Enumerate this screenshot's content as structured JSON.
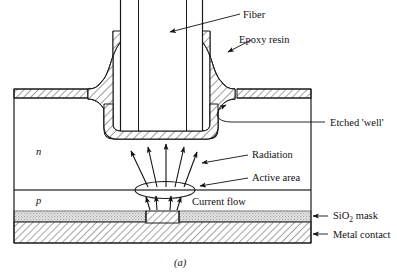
{
  "figure": {
    "caption": "(a)",
    "labels": {
      "fiber": "Fiber",
      "epoxy": "Epoxy resin",
      "etched_well": "Etched 'well'",
      "radiation": "Radiation",
      "active_area": "Active area",
      "current_flow": "Current flow",
      "sio2_mask_pre": "SiO",
      "sio2_mask_sub": "2",
      "sio2_mask_post": " mask",
      "metal_contact": "Metal contact",
      "n_region": "n",
      "p_region": "p"
    },
    "colors": {
      "stroke": "#1a1a1a",
      "hatch": "#555555",
      "sio2_fill": "#d8d8d8",
      "background": "#ffffff"
    }
  }
}
